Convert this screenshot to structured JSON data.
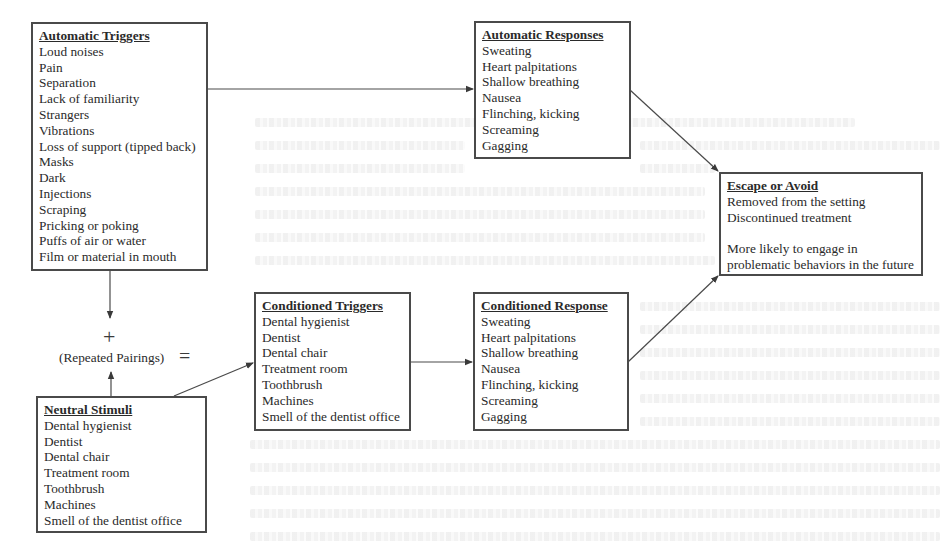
{
  "diagram": {
    "boxes": {
      "automatic_triggers": {
        "title": "Automatic Triggers",
        "items": [
          "Loud noises",
          "Pain",
          "Separation",
          "Lack of familiarity",
          "Strangers",
          "Vibrations",
          "Loss of support (tipped back)",
          "Masks",
          "Dark",
          "Injections",
          "Scraping",
          "Pricking or poking",
          "Puffs of air or water",
          "Film or material in mouth"
        ]
      },
      "automatic_responses": {
        "title": "Automatic Responses",
        "items": [
          "Sweating",
          "Heart palpitations",
          "Shallow breathing",
          "Nausea",
          "Flinching, kicking",
          "Screaming",
          "Gagging"
        ]
      },
      "escape_or_avoid": {
        "title": "Escape or Avoid",
        "items": [
          "Removed from the setting",
          "Discontinued treatment"
        ],
        "note_lines": [
          "More likely to engage in",
          "problematic behaviors in the future"
        ]
      },
      "conditioned_triggers": {
        "title": "Conditioned Triggers",
        "items": [
          "Dental hygienist",
          "Dentist",
          "Dental chair",
          "Treatment room",
          "Toothbrush",
          "Machines",
          "Smell of the dentist office"
        ]
      },
      "conditioned_response": {
        "title": "Conditioned Response",
        "items": [
          "Sweating",
          "Heart palpitations",
          "Shallow breathing",
          "Nausea",
          "Flinching, kicking",
          "Screaming",
          "Gagging"
        ]
      },
      "neutral_stimuli": {
        "title": "Neutral Stimuli",
        "items": [
          "Dental hygienist",
          "Dentist",
          "Dental chair",
          "Treatment room",
          "Toothbrush",
          "Machines",
          "Smell of the dentist office"
        ]
      }
    },
    "operators": {
      "plus": "+",
      "equals": "=",
      "pairing_label": "(Repeated Pairings)"
    },
    "colors": {
      "line": "#4a4a4a",
      "text": "#2a2a2a",
      "background": "#ffffff"
    }
  }
}
